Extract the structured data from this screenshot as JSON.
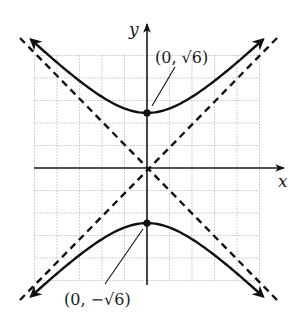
{
  "chart_data": {
    "type": "line",
    "title": "",
    "equation": "y^2/6 - x^2/6 = 1",
    "xlabel": "x",
    "ylabel": "y",
    "xlim": [
      -5,
      5
    ],
    "ylim": [
      -5,
      5
    ],
    "grid": true,
    "grid_step": 1,
    "series": [
      {
        "name": "upper branch",
        "style": "solid",
        "function": "y = sqrt(6 + x^2)",
        "x": [
          -5,
          -4,
          -3,
          -2,
          -1,
          0,
          1,
          2,
          3,
          4,
          5
        ],
        "values": [
          5.57,
          4.69,
          3.87,
          3.16,
          2.65,
          2.45,
          2.65,
          3.16,
          3.87,
          4.69,
          5.57
        ]
      },
      {
        "name": "lower branch",
        "style": "solid",
        "function": "y = -sqrt(6 + x^2)",
        "x": [
          -5,
          -4,
          -3,
          -2,
          -1,
          0,
          1,
          2,
          3,
          4,
          5
        ],
        "values": [
          -5.57,
          -4.69,
          -3.87,
          -3.16,
          -2.65,
          -2.45,
          -2.65,
          -3.16,
          -3.87,
          -4.69,
          -5.57
        ]
      },
      {
        "name": "asymptote y = x",
        "style": "dashed",
        "x": [
          -6,
          6
        ],
        "values": [
          -6,
          6
        ]
      },
      {
        "name": "asymptote y = -x",
        "style": "dashed",
        "x": [
          -6,
          6
        ],
        "values": [
          6,
          -6
        ]
      }
    ],
    "annotations": [
      {
        "label": "(0, √6)",
        "point": [
          0,
          2.449
        ]
      },
      {
        "label": "(0, −√6)",
        "point": [
          0,
          -2.449
        ]
      }
    ]
  },
  "labels": {
    "x_axis": "x",
    "y_axis": "y",
    "vertex_top": "(0, √6)",
    "vertex_bottom": "(0, −√6)"
  },
  "layout": {
    "origin_px": [
      147,
      168
    ],
    "unit_px": 22.5,
    "colors": {
      "ink": "#111111",
      "grid": "#9a9a9a",
      "background": "#ffffff"
    }
  }
}
